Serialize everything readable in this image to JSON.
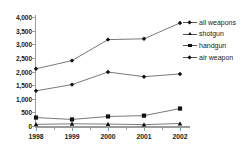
{
  "chart_data": {
    "type": "line",
    "title": "",
    "xlabel": "",
    "ylabel": "",
    "categories": [
      "1998",
      "1999",
      "2000",
      "2001",
      "2002"
    ],
    "ylim": [
      0,
      4000
    ],
    "ytick_values": [
      4000,
      3500,
      3000,
      2500,
      2000,
      1500,
      1000,
      500,
      0
    ],
    "ytick_labels": [
      "4,000",
      "3,500",
      "3,000",
      "2,500",
      "2,000",
      "1,500",
      "1,000",
      "500",
      "0"
    ],
    "grid": false,
    "legend_position": "right",
    "series": [
      {
        "name": "all weapons",
        "marker": "diamond",
        "values": [
          2100,
          2400,
          3170,
          3200,
          3780
        ]
      },
      {
        "name": "shotgun",
        "marker": "triangle",
        "values": [
          60,
          80,
          70,
          50,
          90
        ]
      },
      {
        "name": "handgun",
        "marker": "square",
        "values": [
          310,
          240,
          350,
          380,
          640
        ]
      },
      {
        "name": "air weapon",
        "marker": "diamond",
        "values": [
          1290,
          1520,
          1980,
          1810,
          1910
        ]
      }
    ]
  },
  "legend": {
    "items": [
      {
        "label": "all weapons",
        "marker": "diamond"
      },
      {
        "label": "shotgun",
        "marker": "triangle"
      },
      {
        "label": "handgun",
        "marker": "square"
      },
      {
        "label": "air weapon",
        "marker": "diamond"
      }
    ]
  },
  "colors": {
    "line": "#555555",
    "marker": "#111111",
    "axis": "#9a9a9a",
    "text": "#1a1a1a",
    "background": "#ffffff"
  }
}
